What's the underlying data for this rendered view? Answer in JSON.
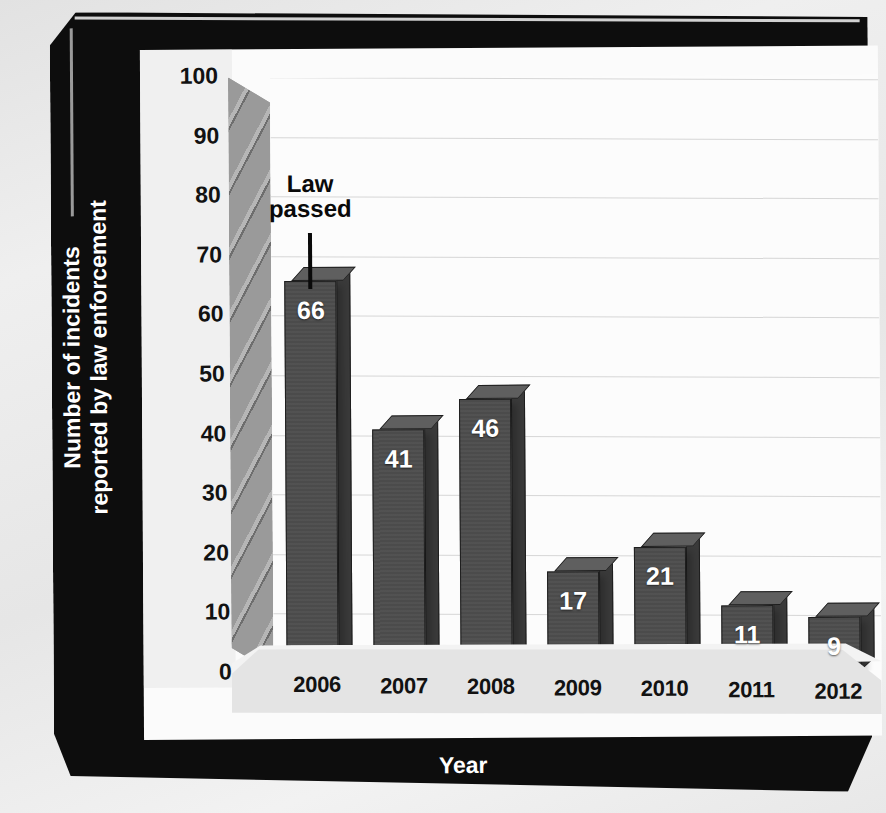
{
  "chart_data": {
    "type": "bar",
    "title": "",
    "xlabel": "Year",
    "ylabel": "Number of incidents\nreported by law enforcement",
    "ylabel_line1": "Number of incidents",
    "ylabel_line2": "reported by law enforcement",
    "categories": [
      "2006",
      "2007",
      "2008",
      "2009",
      "2010",
      "2011",
      "2012"
    ],
    "values": [
      66,
      41,
      46,
      17,
      21,
      11,
      9
    ],
    "ylim": [
      0,
      100
    ],
    "yticks": [
      0,
      10,
      20,
      30,
      40,
      50,
      60,
      70,
      80,
      90,
      100
    ],
    "ytick_labels": [
      "0",
      "10",
      "20",
      "30",
      "40",
      "50",
      "60",
      "70",
      "80",
      "90",
      "100"
    ],
    "grid": true,
    "legend": false,
    "style": "3d-column",
    "annotations": [
      {
        "text": "Law\npassed",
        "line1": "Law",
        "line2": "passed",
        "points_to_category": "2006"
      }
    ],
    "colors": {
      "bar_front": "#4c4c4c",
      "bar_top": "#5f5f5f",
      "bar_side": "#3a3a3a",
      "bar_outline": "#1e1e1e",
      "plot_background": "#fcfcfc",
      "gridline": "#d6d6d6",
      "axis_wall": "#9a9a9a",
      "floor": "#e4e4e4",
      "frame": "#0d0d0d",
      "value_label": "#ffffff",
      "tick_label": "#121212",
      "axis_title": "#ffffff",
      "page_background": "#e9e9e9"
    }
  }
}
